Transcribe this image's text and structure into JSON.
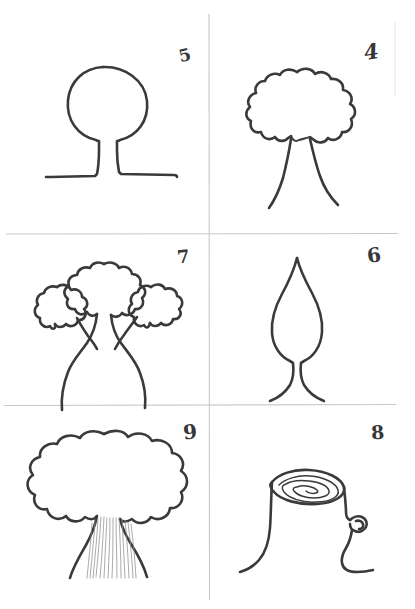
{
  "sheet": {
    "title": "Hand-drawn tree sketch grid",
    "medium": "pen on white paper",
    "ink_color": "#3a3a38",
    "grid_color": "#c9c9c9",
    "background_color": "#ffffff",
    "columns": 2,
    "rows": 3
  },
  "grid": {
    "vertical_line_x": 209,
    "horizontal_line_y": [
      234,
      405
    ],
    "right_edge_x": 395
  },
  "panels": [
    {
      "number": "5",
      "position": "top-left",
      "subject": "tree with round canopy on short trunk over ground line",
      "label_corner": "top-right"
    },
    {
      "number": "4",
      "position": "top-right",
      "subject": "tree with scalloped cloud canopy and two splayed trunk lines",
      "label_corner": "top-right"
    },
    {
      "number": "7",
      "position": "middle-left",
      "subject": "tree with three scalloped leaf clusters on curved branches",
      "label_corner": "top-right"
    },
    {
      "number": "6",
      "position": "middle-right",
      "subject": "tree with pointed teardrop canopy on flared trunk",
      "label_corner": "top-right"
    },
    {
      "number": "9",
      "position": "bottom-left",
      "subject": "broad scalloped canopy with hatched wide trunk",
      "label_corner": "top-right"
    },
    {
      "number": "8",
      "position": "bottom-right",
      "subject": "cut tree stump showing growth rings with side branch stub",
      "label_corner": "top-right"
    }
  ]
}
